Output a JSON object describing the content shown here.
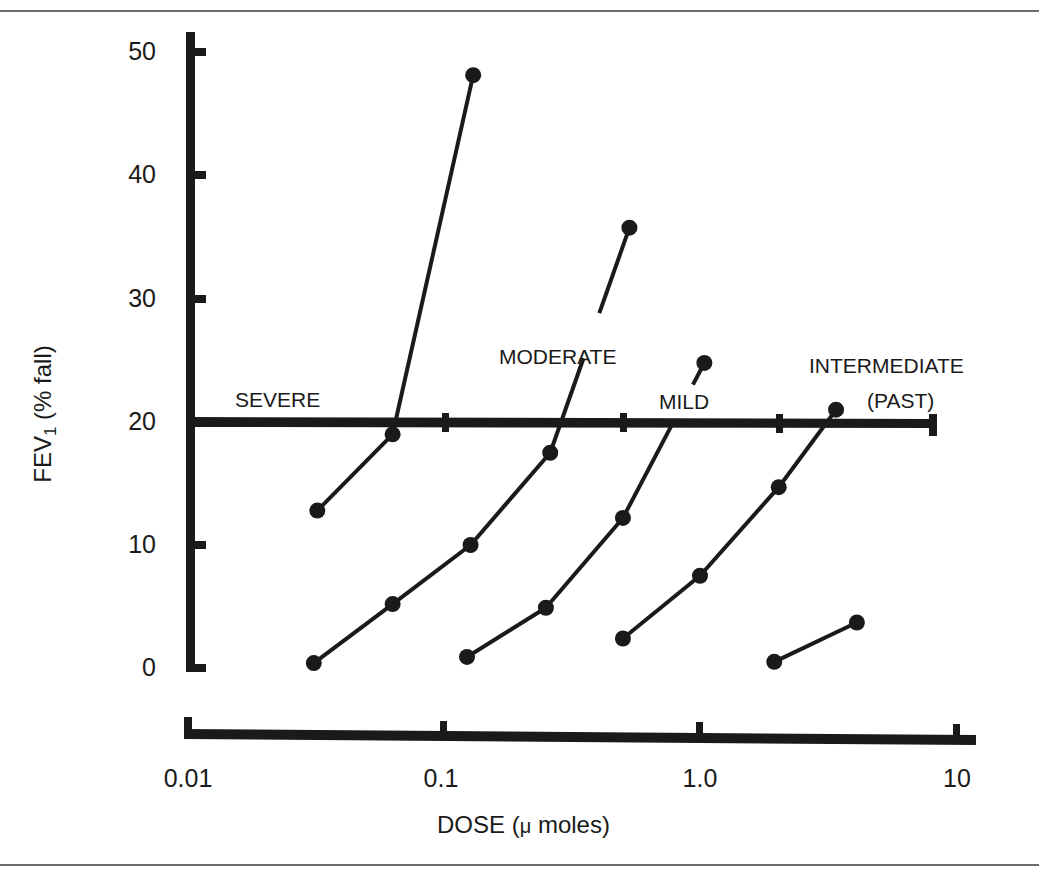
{
  "chart_data": {
    "type": "line",
    "title": "",
    "xlabel": "DOSE (μ moles)",
    "xlabel_parts": {
      "main": "DOSE (",
      "mu": "μ",
      "rest": " moles)"
    },
    "ylabel": "FEV1 (% fall)",
    "ylabel_parts": {
      "main": "FEV",
      "sub": "1",
      "rest": " (% fall)"
    },
    "x_scale": "log",
    "xlim": [
      0.01,
      10
    ],
    "ylim": [
      0,
      50
    ],
    "x_ticks": [
      "0.01",
      "0.1",
      "1.0",
      "10"
    ],
    "y_ticks": [
      "0",
      "10",
      "20",
      "30",
      "40",
      "50"
    ],
    "grid": false,
    "legend": "none (direct labels)",
    "reference_line": {
      "y": 20,
      "label": "20% fall threshold",
      "x_range": [
        0.01,
        8
      ]
    },
    "series": [
      {
        "name": "SEVERE",
        "x": [
          0.032,
          0.063,
          0.13
        ],
        "y": [
          12.8,
          19.0,
          48.2
        ]
      },
      {
        "name": "MODERATE",
        "x": [
          0.031,
          0.063,
          0.127,
          0.26,
          0.53
        ],
        "y": [
          0.4,
          5.2,
          10.0,
          17.5,
          35.8
        ]
      },
      {
        "name": "MILD",
        "x": [
          0.123,
          0.25,
          0.5,
          1.04
        ],
        "y": [
          0.9,
          4.9,
          12.2,
          24.8
        ]
      },
      {
        "name": "INTERMEDIATE",
        "x": [
          0.5,
          1.0,
          2.03,
          3.4
        ],
        "y": [
          2.4,
          7.5,
          14.7,
          21.0
        ]
      },
      {
        "name": "(PAST)",
        "x": [
          1.95,
          4.1
        ],
        "y": [
          0.5,
          3.7
        ]
      }
    ]
  },
  "labels": {
    "severe": "SEVERE",
    "moderate": "MODERATE",
    "mild": "MILD",
    "intermediate": "INTERMEDIATE",
    "past": "(PAST)"
  },
  "colors": {
    "ink": "#1a1a1a",
    "frame": "#6e6e6e",
    "background": "#ffffff"
  }
}
